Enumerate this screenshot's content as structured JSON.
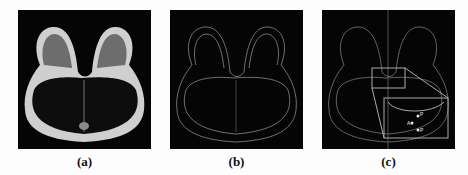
{
  "figure": {
    "panels": [
      {
        "id": "a",
        "label": "(a)",
        "description": "Axial breast MRI slice (original image)"
      },
      {
        "id": "b",
        "label": "(b)",
        "description": "Edge-detected breast MRI slice"
      },
      {
        "id": "c",
        "label": "(c)",
        "description": "Edge map with highlighted region and magnified inset"
      }
    ],
    "inset_markers": [
      "P",
      "A",
      "P"
    ],
    "colors": {
      "background": "#050505",
      "tissue": "#d8d8d8",
      "edge": "#9a9a9a",
      "page": "#fdfdfd"
    }
  }
}
